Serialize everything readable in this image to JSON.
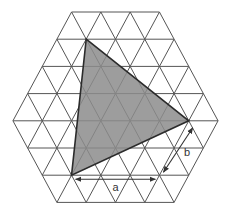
{
  "diagram": {
    "grid": {
      "rows": 8,
      "segments_per_row": [
        3,
        4,
        5,
        6,
        7,
        6,
        5,
        4
      ],
      "unit_x": 29.3,
      "row_height": 27.2,
      "top_y": 12,
      "center_x": 115.5,
      "line_color": "#555555"
    },
    "shaded_triangle": {
      "vertices_grid": [
        [
          1,
          1
        ],
        [
          4,
          6
        ],
        [
          6,
          1
        ]
      ],
      "fill_color": "#8c8c8c",
      "stroke_color": "#2b2b2b"
    },
    "dimensions": [
      {
        "label": "a",
        "from_grid": [
          6,
          1
        ],
        "to_grid": [
          6,
          4
        ],
        "offset": [
          0,
          4
        ]
      },
      {
        "label": "b",
        "from_grid": [
          4,
          6
        ],
        "to_grid": [
          6,
          4
        ],
        "offset": [
          4,
          2
        ]
      }
    ],
    "labels": {
      "a": "a",
      "b": "b"
    }
  }
}
